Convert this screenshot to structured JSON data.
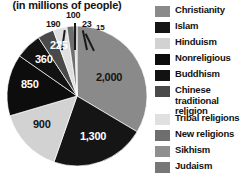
{
  "subtitle": "(in millions of people)",
  "chart_data": {
    "type": "pie",
    "title": "",
    "subtitle": "(in millions of people)",
    "unit": "millions of people",
    "xlabel": "",
    "ylabel": "",
    "grid": false,
    "legend_position": "right",
    "total": 5963,
    "categories": [
      "Christianity",
      "Islam",
      "Hinduism",
      "Nonreligious",
      "Buddhism",
      "Chinese traditional religion",
      "Tribal religions",
      "New religions",
      "Sikhism",
      "Judaism"
    ],
    "values": [
      2000,
      1300,
      900,
      850,
      360,
      225,
      190,
      100,
      23,
      15
    ],
    "value_labels": [
      "2,000",
      "1,300",
      "900",
      "850",
      "360",
      "225",
      "190",
      "100",
      "23",
      "15"
    ],
    "colors": [
      "#8a8a8a",
      "#151515",
      "#d2d2d2",
      "#0d0d0d",
      "#121212",
      "#4a4a4a",
      "#e0e0e0",
      "#6e6e6e",
      "#8f8f8f",
      "#777777"
    ],
    "slices": [
      {
        "name": "Christianity",
        "value": 2000,
        "label": "2,000",
        "color": "#8a8a8a",
        "label_color": "dark"
      },
      {
        "name": "Islam",
        "value": 1300,
        "label": "1,300",
        "color": "#151515",
        "label_color": "light"
      },
      {
        "name": "Hinduism",
        "value": 900,
        "label": "900",
        "color": "#d2d2d2",
        "label_color": "dark"
      },
      {
        "name": "Nonreligious",
        "value": 850,
        "label": "850",
        "color": "#0d0d0d",
        "label_color": "light"
      },
      {
        "name": "Buddhism",
        "value": 360,
        "label": "360",
        "color": "#121212",
        "label_color": "light"
      },
      {
        "name": "Chinese traditional religion",
        "value": 225,
        "label": "225",
        "color": "#4a4a4a",
        "label_color": "light"
      },
      {
        "name": "Tribal religions",
        "value": 190,
        "label": "190",
        "color": "#e0e0e0",
        "label_color": "dark"
      },
      {
        "name": "New religions",
        "value": 100,
        "label": "100",
        "color": "#6e6e6e",
        "label_color": "dark"
      },
      {
        "name": "Sikhism",
        "value": 23,
        "label": "23",
        "color": "#8f8f8f",
        "label_color": "dark"
      },
      {
        "name": "Judaism",
        "value": 15,
        "label": "15",
        "color": "#777777",
        "label_color": "dark"
      }
    ]
  },
  "legend": {
    "items": [
      {
        "label": "Christianity",
        "color": "#8a8a8a"
      },
      {
        "label": "Islam",
        "color": "#151515"
      },
      {
        "label": "Hinduism",
        "color": "#d2d2d2"
      },
      {
        "label": "Nonreligious",
        "color": "#0d0d0d"
      },
      {
        "label": "Buddhism",
        "color": "#121212"
      },
      {
        "label": "Chinese traditional religion",
        "color": "#4a4a4a"
      },
      {
        "label": "Tribal religions",
        "color": "#e0e0e0"
      },
      {
        "label": "New religions",
        "color": "#6e6e6e"
      },
      {
        "label": "Sikhism",
        "color": "#8f8f8f"
      },
      {
        "label": "Judaism",
        "color": "#777777"
      }
    ]
  }
}
